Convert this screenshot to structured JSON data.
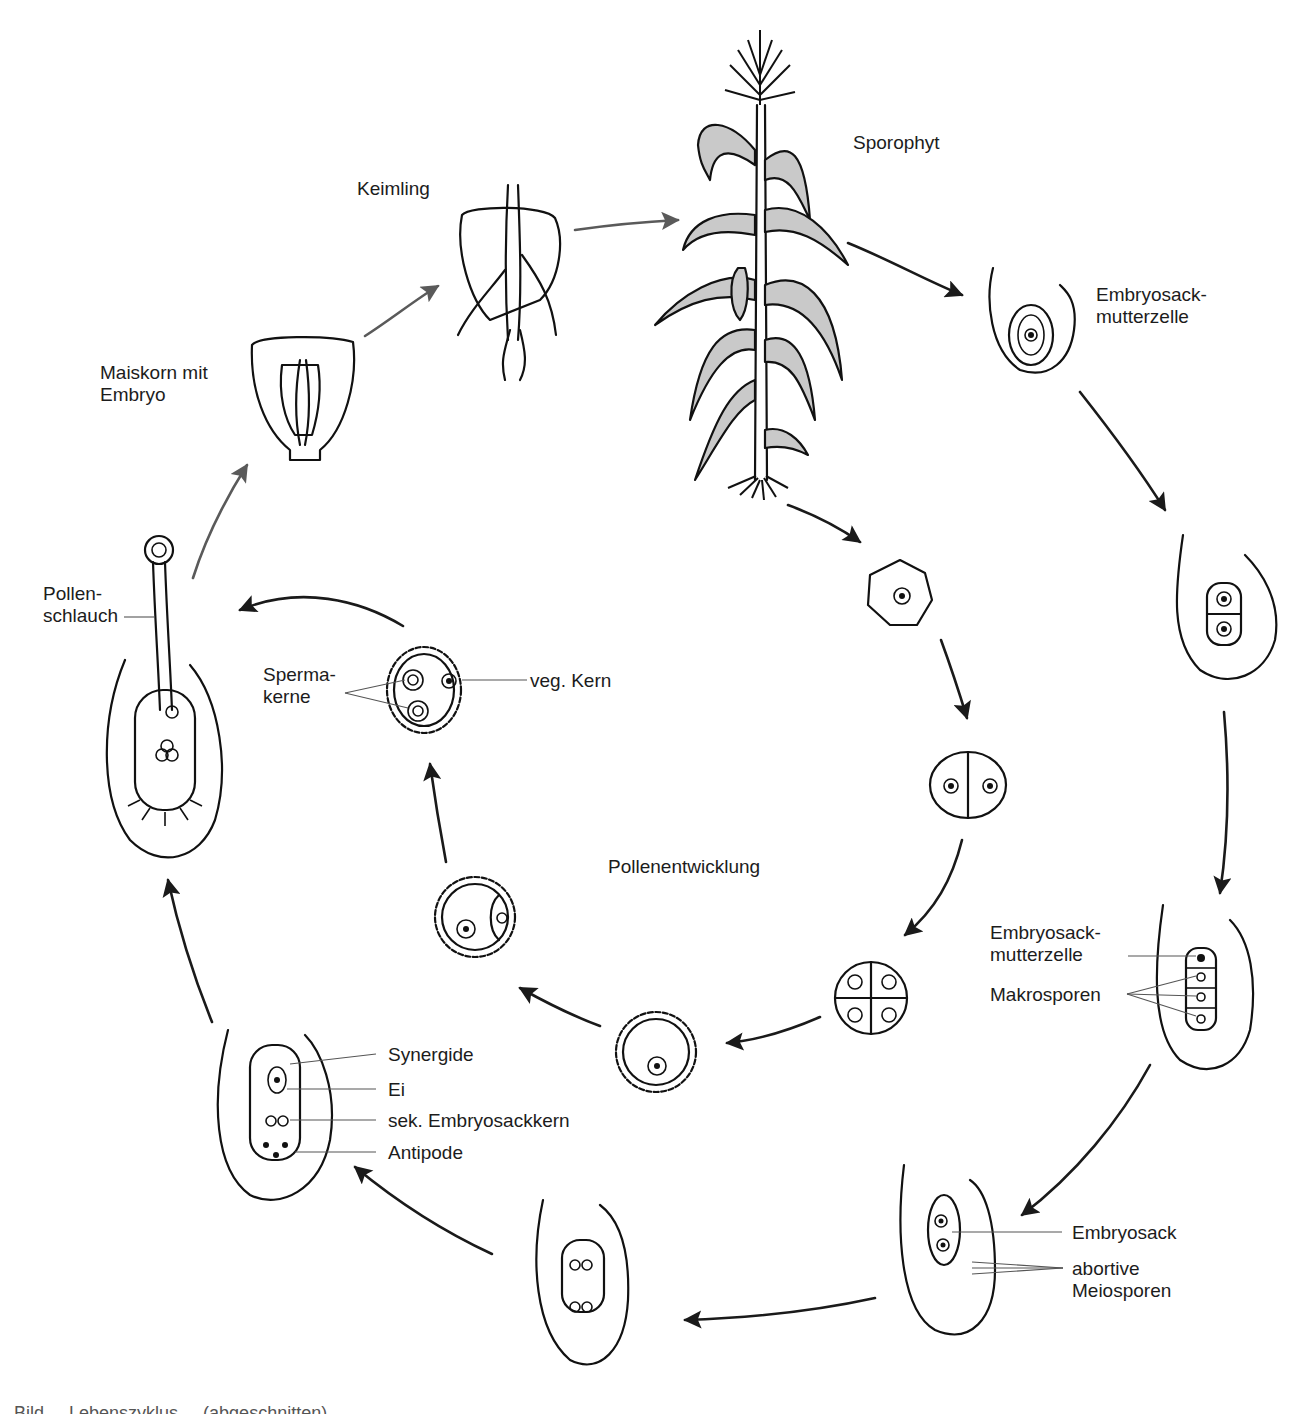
{
  "diagram": {
    "colors": {
      "ink": "#111111",
      "leaf_fill": "#c9c9c9",
      "gray_arrow": "#5a5a5a",
      "black_arrow": "#1a1a1a",
      "label": "#1c1c1c"
    },
    "stages": [
      {
        "id": "sporophyt",
        "label": "Sporophyt"
      },
      {
        "id": "keimling",
        "label": "Keimling"
      },
      {
        "id": "maiskorn",
        "label": "Maiskorn mit\nEmbryo"
      },
      {
        "id": "pollenschlauch",
        "label": "Pollen-\nschlauch"
      },
      {
        "id": "embryosackmutterzelle_1",
        "label": "Embryosack-\nmutterzelle"
      },
      {
        "id": "pollenentwicklung",
        "label": "Pollenentwicklung"
      }
    ],
    "pollen_labels": {
      "spermakerne": "Sperma-\nkerne",
      "veg_kern": "veg. Kern"
    },
    "megaspore_labels": {
      "embryosackmutterzelle": "Embryosack-\nmutterzelle",
      "makrosporen": "Makrosporen"
    },
    "embryosack_labels": {
      "embryosack": "Embryosack",
      "abortive_meiosporen": "abortive\nMeiosporen"
    },
    "mature_sac_labels": {
      "synergide": "Synergide",
      "ei": "Ei",
      "sek_embryosackkern": "sek. Embryosackkern",
      "antipode": "Antipode"
    },
    "caption": "Bild ... Lebenszyklus ... (abgeschnitten)"
  }
}
